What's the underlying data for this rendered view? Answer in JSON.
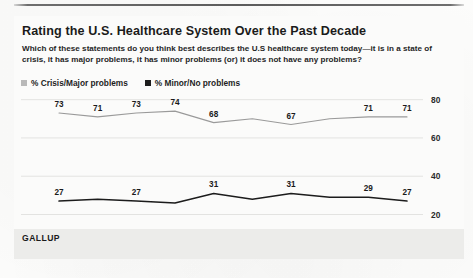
{
  "header": {
    "title": "Rating the U.S. Healthcare System Over the Past Decade",
    "subtitle": "Which of these statements do you think best describes the U.S healthcare system today—it is in a state of crisis, it has major problems, it has minor problems (or) it does not have any problems?"
  },
  "legend": {
    "items": [
      {
        "label": "% Crisis/Major problems",
        "color": "#b9b9b9",
        "marker": "square-swatch"
      },
      {
        "label": "% Minor/No problems",
        "color": "#1c1c1c",
        "marker": "square-swatch"
      }
    ]
  },
  "source": {
    "label": "GALLUP"
  },
  "chart_data": {
    "type": "line",
    "title": "Rating the U.S. Healthcare System Over the Past Decade",
    "subtitle": "Which of these statements do you think best describes the U.S healthcare system today—it is in a state of crisis, it has major problems, it has minor problems (or) it does not have any problems?",
    "xlabel": "",
    "ylabel": "",
    "categories": [
      "2008",
      "2009",
      "2010",
      "2011",
      "2012",
      "2013",
      "2014",
      "2015",
      "2016",
      "2017"
    ],
    "x": [
      2008,
      2009,
      2010,
      2011,
      2012,
      2013,
      2014,
      2015,
      2016,
      2017
    ],
    "ylim": [
      14,
      84
    ],
    "yticks": [
      20,
      40,
      60,
      80
    ],
    "ytick_labels": [
      "20",
      "40",
      "60",
      "80"
    ],
    "y_axis_position": "right",
    "grid": "horizontal",
    "legend_position": "top-left",
    "series": [
      {
        "name": "% Crisis/Major problems",
        "color": "#9a9a9a",
        "values": [
          73,
          71,
          73,
          74,
          68,
          70,
          67,
          70,
          71,
          71
        ],
        "point_labels": [
          "73",
          "71",
          "73",
          "74",
          "68",
          "",
          "67",
          "",
          "71",
          "71"
        ]
      },
      {
        "name": "% Minor/No problems",
        "color": "#1c1c1c",
        "values": [
          27,
          28,
          27,
          26,
          31,
          28,
          31,
          29,
          29,
          27
        ],
        "point_labels": [
          "27",
          "",
          "27",
          "",
          "31",
          "",
          "31",
          "",
          "29",
          "27"
        ]
      }
    ]
  }
}
